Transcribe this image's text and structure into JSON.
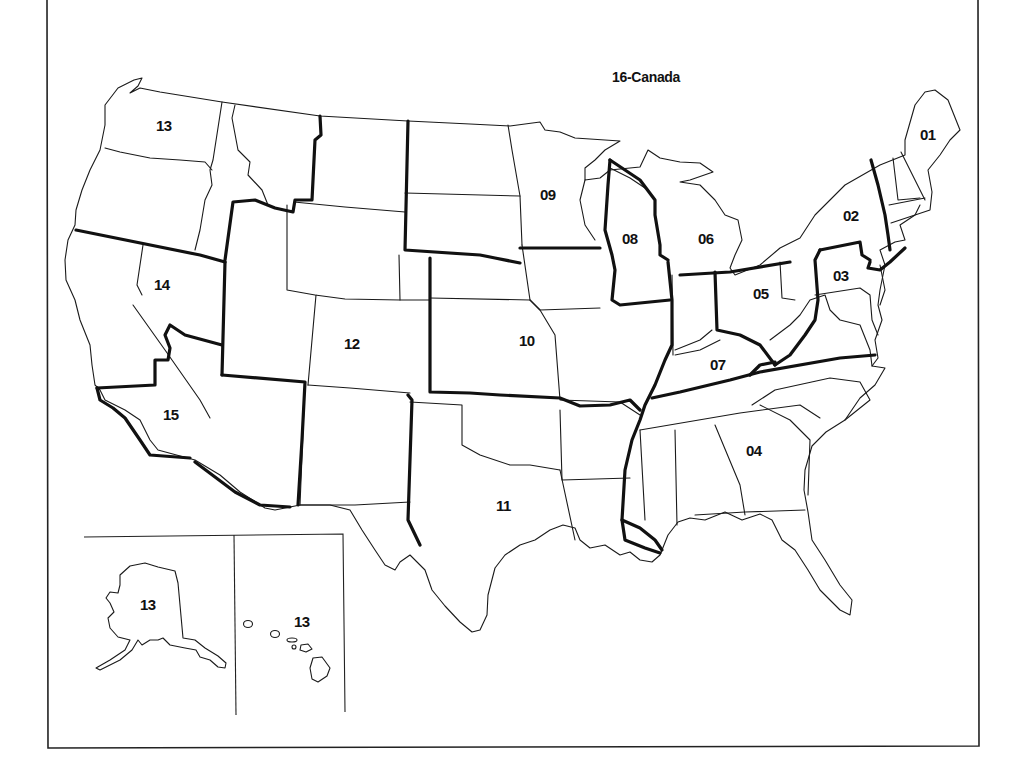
{
  "map": {
    "title_label": "16-Canada",
    "style": {
      "background": "#ffffff",
      "line_color": "#1a1a1a"
    },
    "regions": [
      {
        "id": "r01",
        "label": "01",
        "note": "New England"
      },
      {
        "id": "r02",
        "label": "02",
        "note": "New York"
      },
      {
        "id": "r03",
        "label": "03",
        "note": "Mid-Atlantic"
      },
      {
        "id": "r04",
        "label": "04",
        "note": "Southeast"
      },
      {
        "id": "r05",
        "label": "05",
        "note": "Ohio"
      },
      {
        "id": "r06",
        "label": "06",
        "note": "Michigan"
      },
      {
        "id": "r07",
        "label": "07",
        "note": "Kentucky / Indiana / Tennessee"
      },
      {
        "id": "r08",
        "label": "08",
        "note": "Wisconsin / Illinois"
      },
      {
        "id": "r09",
        "label": "09",
        "note": "Upper Midwest"
      },
      {
        "id": "r10",
        "label": "10",
        "note": "Central Plains"
      },
      {
        "id": "r11",
        "label": "11",
        "note": "South Central"
      },
      {
        "id": "r12",
        "label": "12",
        "note": "Mountain"
      },
      {
        "id": "r13",
        "label": "13",
        "note": "Northwest"
      },
      {
        "id": "r14",
        "label": "14",
        "note": "Northern California / Nevada"
      },
      {
        "id": "r15",
        "label": "15",
        "note": "Southern California"
      }
    ],
    "insets": {
      "alaska_label": "13",
      "hawaii_label": "13"
    }
  }
}
